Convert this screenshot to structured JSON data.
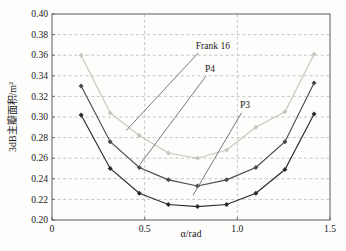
{
  "figure": {
    "background": "#fdfdfc",
    "frame_color": "#5a5a5a",
    "text_color": "#1a1a1a"
  },
  "chart_data": {
    "type": "line",
    "title": "",
    "xlabel": "α/rad",
    "ylabel": "3dB主瓣面积/m²",
    "xlim": [
      0,
      1.5
    ],
    "ylim": [
      0.2,
      0.4
    ],
    "xticks": {
      "values": [
        0,
        0.5,
        1.0,
        1.5
      ],
      "labels": [
        "0",
        "0.5",
        "1.0",
        "1.5"
      ]
    },
    "yticks": {
      "values": [
        0.2,
        0.22,
        0.24,
        0.26,
        0.28,
        0.3,
        0.32,
        0.34,
        0.36,
        0.38,
        0.4
      ],
      "labels": [
        "0.20",
        "0.22",
        "0.24",
        "0.26",
        "0.28",
        "0.30",
        "0.32",
        "0.34",
        "0.36",
        "0.38",
        "0.40"
      ]
    },
    "grid": {
      "on": true,
      "dashed": true,
      "color": "#c0c0c0",
      "x_gridlines": [
        0.5,
        1.0
      ]
    },
    "legend": "inline-annotations",
    "x": [
      0.157,
      0.314,
      0.471,
      0.628,
      0.785,
      0.942,
      1.1,
      1.257,
      1.414
    ],
    "series": [
      {
        "name": "Frank 16",
        "color": "#c7c5bf",
        "values": [
          0.36,
          0.304,
          0.282,
          0.265,
          0.26,
          0.268,
          0.29,
          0.305,
          0.361
        ]
      },
      {
        "name": "P4",
        "color": "#4a4a48",
        "values": [
          0.33,
          0.276,
          0.251,
          0.239,
          0.233,
          0.239,
          0.251,
          0.276,
          0.333
        ]
      },
      {
        "name": "P3",
        "color": "#2a2a28",
        "values": [
          0.302,
          0.25,
          0.226,
          0.215,
          0.213,
          0.215,
          0.226,
          0.249,
          0.303
        ]
      }
    ],
    "annotations": [
      {
        "text": "Frank 16",
        "label_x": 0.775,
        "label_y": 0.3665,
        "line_from": [
          0.788,
          0.362
        ],
        "line_to": [
          0.4,
          0.2868
        ],
        "line_color": "#6b6b6b"
      },
      {
        "text": "P4",
        "label_x": 0.825,
        "label_y": 0.3435,
        "line_from": [
          0.83,
          0.3395
        ],
        "line_to": [
          0.475,
          0.254
        ],
        "line_color": "#6b6b6b"
      },
      {
        "text": "P3",
        "label_x": 1.014,
        "label_y": 0.3085,
        "line_from": [
          1.022,
          0.304
        ],
        "line_to": [
          0.761,
          0.224
        ],
        "line_color": "#6b6b6b"
      }
    ]
  }
}
